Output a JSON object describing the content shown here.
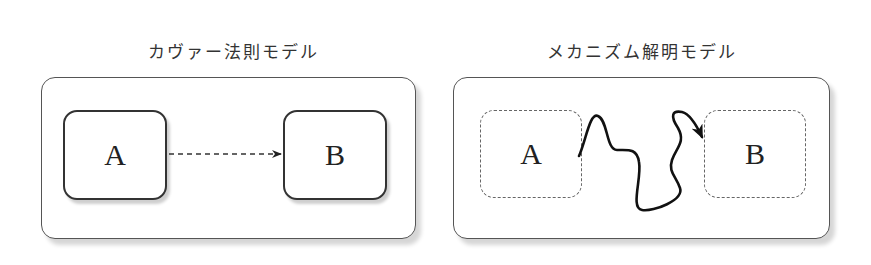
{
  "panels": [
    {
      "title": "カヴァー法則モデル",
      "node_a": "A",
      "node_b": "B",
      "node_style": "solid",
      "connection": "dashed-straight-arrow"
    },
    {
      "title": "メカニズム解明モデル",
      "node_a": "A",
      "node_b": "B",
      "node_style": "dashed",
      "connection": "wavy-solid-arrow"
    }
  ],
  "colors": {
    "stroke": "#333333",
    "shadow": "#d6d6d6",
    "background": "#ffffff"
  }
}
